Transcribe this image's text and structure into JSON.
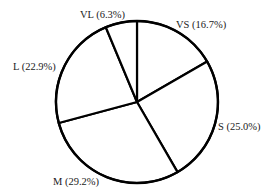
{
  "chart_data": {
    "type": "pie",
    "title": "",
    "start_angle_deg": 0,
    "direction": "clockwise",
    "categories": [
      "VS",
      "S",
      "M",
      "L",
      "VL"
    ],
    "values": [
      16.7,
      25.0,
      29.2,
      22.9,
      6.3
    ],
    "labels": [
      "VS (16.7%)",
      "S (25.0%)",
      "M (29.2%)",
      "L (22.9%)",
      "VL (6.3%)"
    ],
    "fill_color": "#ffffff",
    "stroke_color": "#000000",
    "legend": "none",
    "label_positions": [
      {
        "x": 176,
        "y": 28
      },
      {
        "x": 218,
        "y": 130
      },
      {
        "x": 53,
        "y": 185
      },
      {
        "x": 13,
        "y": 70
      },
      {
        "x": 80,
        "y": 18
      }
    ],
    "geometry": {
      "cx": 137,
      "cy": 102,
      "r": 81
    }
  }
}
